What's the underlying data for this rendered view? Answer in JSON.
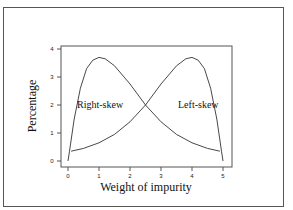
{
  "chart_data": {
    "type": "line",
    "title": "",
    "xlabel": "Weight of impurity",
    "ylabel": "Percentage",
    "xlim": [
      0,
      5
    ],
    "ylim": [
      0,
      4
    ],
    "xticks": [
      "0",
      "1",
      "2",
      "3",
      "4",
      "5"
    ],
    "yticks": [
      "0",
      "1",
      "2",
      "3",
      "4"
    ],
    "grid": false,
    "legend": "none",
    "annotations": [
      "Right-skew",
      "Left-skew"
    ],
    "series": [
      {
        "name": "Right-skew",
        "x": [
          0,
          0.05,
          0.2,
          0.4,
          0.6,
          0.8,
          1.0,
          1.2,
          1.5,
          2.0,
          2.5,
          3.0,
          3.5,
          4.0,
          4.5,
          4.9
        ],
        "y": [
          0.0,
          0.35,
          1.5,
          2.6,
          3.3,
          3.6,
          3.7,
          3.65,
          3.4,
          2.75,
          2.0,
          1.4,
          0.95,
          0.65,
          0.45,
          0.35
        ]
      },
      {
        "name": "Left-skew",
        "x": [
          0.1,
          0.5,
          1.0,
          1.5,
          2.0,
          2.5,
          3.0,
          3.5,
          3.8,
          4.0,
          4.2,
          4.4,
          4.6,
          4.8,
          4.95,
          5.0
        ],
        "y": [
          0.35,
          0.45,
          0.65,
          0.95,
          1.4,
          2.0,
          2.75,
          3.4,
          3.65,
          3.7,
          3.6,
          3.3,
          2.6,
          1.5,
          0.35,
          0.0
        ]
      }
    ]
  }
}
